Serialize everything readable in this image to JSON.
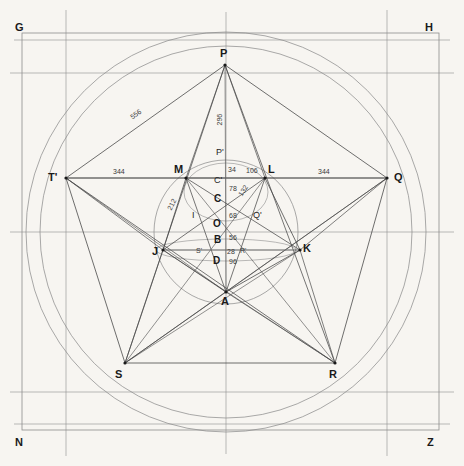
{
  "figure": {
    "background_color": "#f7f5f1",
    "line_color": "#4a4a4a",
    "thin_line_color": "#8d8d8d",
    "text_color": "#1a1a1a"
  },
  "corner_labels": [
    {
      "name": "G",
      "text": "G",
      "x": 15,
      "y": 22
    },
    {
      "name": "H",
      "text": "H",
      "x": 425,
      "y": 22
    },
    {
      "name": "N",
      "text": "N",
      "x": 15,
      "y": 437
    },
    {
      "name": "Z",
      "text": "Z",
      "x": 427,
      "y": 437
    }
  ],
  "outer_vertices": [
    {
      "name": "P",
      "text": "P",
      "x": 225,
      "y": 65,
      "lx": 220,
      "ly": 48
    },
    {
      "name": "T'",
      "text": "T'",
      "x": 66,
      "y": 178,
      "lx": 50,
      "ly": 173
    },
    {
      "name": "Q",
      "text": "Q",
      "x": 387,
      "y": 178,
      "lx": 394,
      "ly": 173
    },
    {
      "name": "S",
      "text": "S",
      "x": 125,
      "y": 363,
      "lx": 116,
      "ly": 370
    },
    {
      "name": "R",
      "text": "R",
      "x": 335,
      "y": 363,
      "lx": 330,
      "ly": 370
    }
  ],
  "inner_vertices": [
    {
      "name": "M",
      "text": "M",
      "x": 186,
      "y": 178,
      "lx": 174,
      "ly": 165
    },
    {
      "name": "L",
      "text": "L",
      "x": 265,
      "y": 178,
      "lx": 269,
      "ly": 165
    },
    {
      "name": "J",
      "text": "J",
      "x": 163,
      "y": 250,
      "lx": 152,
      "ly": 248
    },
    {
      "name": "K",
      "text": "K",
      "x": 300,
      "y": 250,
      "lx": 303,
      "ly": 244
    },
    {
      "name": "A",
      "text": "A",
      "x": 226,
      "y": 292,
      "lx": 221,
      "ly": 297
    }
  ],
  "axis_points": [
    {
      "name": "P-prime",
      "text": "P'",
      "x": 219,
      "y": 152
    },
    {
      "name": "C-prime",
      "text": "C'",
      "x": 218,
      "y": 180
    },
    {
      "name": "C",
      "text": "C",
      "x": 218,
      "y": 199
    },
    {
      "name": "O",
      "text": "O",
      "x": 217,
      "y": 224
    },
    {
      "name": "B",
      "text": "B",
      "x": 218,
      "y": 240
    },
    {
      "name": "D",
      "text": "D",
      "x": 217,
      "y": 260
    },
    {
      "name": "I",
      "text": "I",
      "x": 194,
      "y": 215
    },
    {
      "name": "Q-prime",
      "text": "Q'",
      "x": 255,
      "y": 215
    },
    {
      "name": "S-prime",
      "text": "S'",
      "x": 198,
      "y": 250
    },
    {
      "name": "R-prime",
      "text": "R'",
      "x": 241,
      "y": 250
    }
  ],
  "dimensions": [
    {
      "name": "dim-556",
      "text": "556",
      "x": 131,
      "y": 114,
      "rotate": -35
    },
    {
      "name": "dim-296",
      "text": "296",
      "x": 219,
      "y": 117,
      "rotate": -90
    },
    {
      "name": "dim-344-left",
      "text": "344",
      "x": 113,
      "y": 171,
      "rotate": 0
    },
    {
      "name": "dim-344-right",
      "text": "344",
      "x": 318,
      "y": 171,
      "rotate": 0
    },
    {
      "name": "dim-212",
      "text": "212",
      "x": 170,
      "y": 204,
      "rotate": -62
    },
    {
      "name": "dim-34",
      "text": "34",
      "x": 228,
      "y": 168,
      "rotate": 0
    },
    {
      "name": "dim-106",
      "text": "106",
      "x": 245,
      "y": 170,
      "rotate": 0
    },
    {
      "name": "dim-78",
      "text": "78",
      "x": 228,
      "y": 188,
      "rotate": 0
    },
    {
      "name": "dim-132",
      "text": "132",
      "x": 241,
      "y": 192,
      "rotate": -58
    },
    {
      "name": "dim-68",
      "text": "68",
      "x": 228,
      "y": 215,
      "rotate": 0
    },
    {
      "name": "dim-56",
      "text": "56",
      "x": 228,
      "y": 237,
      "rotate": 0
    },
    {
      "name": "dim-28",
      "text": "28",
      "x": 226,
      "y": 251,
      "rotate": 0
    },
    {
      "name": "dim-96",
      "text": "96",
      "x": 228,
      "y": 261,
      "rotate": 0
    }
  ],
  "geometry": {
    "center": {
      "x": 226,
      "y": 232
    },
    "circle_outer_radius": 200,
    "circle_inner_radius": 186,
    "circle_small_radius": 72,
    "frame_rect": {
      "x": 22,
      "y": 33,
      "w": 417,
      "h": 397
    },
    "grid_vertical_x": [
      66,
      387
    ],
    "grid_horizontal_y": [
      73,
      232,
      392
    ],
    "axis_vertical_x": 226,
    "ellipse_upper": {
      "cx": 226,
      "cy": 178,
      "rx": 42,
      "ry": 29
    },
    "ellipse_lower": {
      "cx": 232,
      "cy": 250,
      "rx": 70,
      "ry": 11
    }
  }
}
